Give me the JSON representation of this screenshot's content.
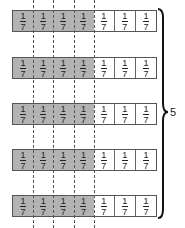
{
  "diagram": {
    "rows": [
      {
        "cells": [
          "1/7",
          "1/7",
          "1/7",
          "1/7",
          "1/7",
          "1/7",
          "1/7"
        ],
        "shaded": 4
      },
      {
        "cells": [
          "1/7",
          "1/7",
          "1/7",
          "1/7",
          "1/7",
          "1/7",
          "1/7"
        ],
        "shaded": 4
      },
      {
        "cells": [
          "1/7",
          "1/7",
          "1/7",
          "1/7",
          "1/7",
          "1/7",
          "1/7"
        ],
        "shaded": 4
      },
      {
        "cells": [
          "1/7",
          "1/7",
          "1/7",
          "1/7",
          "1/7",
          "1/7",
          "1/7"
        ],
        "shaded": 4
      },
      {
        "cells": [
          "1/7",
          "1/7",
          "1/7",
          "1/7",
          "1/7",
          "1/7",
          "1/7"
        ],
        "shaded": 4
      }
    ],
    "numerator": "1",
    "denominator": "7",
    "brace_label": "5",
    "colors": {
      "shaded": "#b3b3b3",
      "unshaded": "#ffffff",
      "border": "#555555"
    }
  }
}
